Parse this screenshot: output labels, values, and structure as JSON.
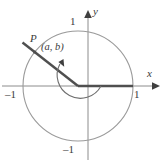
{
  "figure": {
    "colors": {
      "circle_stroke": "#9a9a9a",
      "axis_stroke": "#8c8c8c",
      "ray_stroke": "#4f4f4f",
      "arc_stroke": "#6e6e6e",
      "text": "#3a3a3a",
      "background": "#ffffff"
    },
    "axes": {
      "x_label": "x",
      "y_label": "y",
      "ticks": {
        "top": "1",
        "right": "1",
        "left": "–1",
        "bottom": "–1"
      }
    },
    "point": {
      "name": "P",
      "coordinates_label": "(a, b)"
    },
    "geometry": {
      "center_x": 78,
      "center_y": 86,
      "radius": 55,
      "ray_angle_degrees": 142,
      "arc_radius": 23
    }
  }
}
